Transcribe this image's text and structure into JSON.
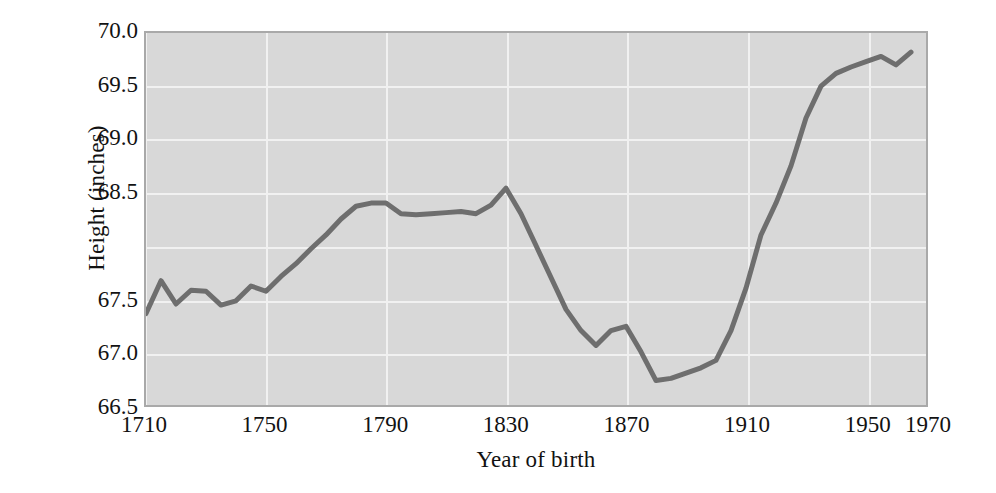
{
  "chart_data": {
    "type": "line",
    "title": "",
    "xlabel": "Year of birth",
    "ylabel": "Height (inches)",
    "xlim": [
      1710,
      1970
    ],
    "ylim": [
      66.5,
      70.0
    ],
    "grid": true,
    "legend": "none",
    "xticks": [
      "1710",
      "1750",
      "1790",
      "1830",
      "1870",
      "1910",
      "1950",
      "1970"
    ],
    "xtick_values": [
      1710,
      1750,
      1790,
      1830,
      1870,
      1910,
      1950,
      1970
    ],
    "yticks": [
      "70.0",
      "69.5",
      "69.0",
      "68.5",
      "",
      "67.5",
      "67.0",
      "66.5"
    ],
    "ytick_values": [
      70.0,
      69.5,
      69.0,
      68.5,
      68.0,
      67.5,
      67.0,
      66.5
    ],
    "series": [
      {
        "name": "Mean height by year of birth",
        "color": "#6e6e6e",
        "line_width": 5,
        "x": [
          1710,
          1715,
          1720,
          1725,
          1730,
          1735,
          1740,
          1745,
          1750,
          1755,
          1760,
          1765,
          1770,
          1775,
          1780,
          1785,
          1790,
          1795,
          1800,
          1805,
          1810,
          1815,
          1820,
          1825,
          1830,
          1835,
          1840,
          1845,
          1850,
          1855,
          1860,
          1865,
          1870,
          1875,
          1880,
          1885,
          1890,
          1895,
          1900,
          1905,
          1910,
          1915,
          1920,
          1925,
          1930,
          1935,
          1940,
          1945,
          1950,
          1955,
          1960,
          1965
        ],
        "y": [
          67.36,
          67.67,
          67.45,
          67.58,
          67.57,
          67.44,
          67.48,
          67.62,
          67.57,
          67.71,
          67.83,
          67.97,
          68.1,
          68.25,
          68.37,
          68.4,
          68.4,
          68.3,
          68.29,
          68.3,
          68.31,
          68.32,
          68.3,
          68.38,
          68.54,
          68.3,
          68.0,
          67.7,
          67.4,
          67.2,
          67.06,
          67.2,
          67.24,
          67.0,
          66.73,
          66.75,
          66.8,
          66.85,
          66.92,
          67.2,
          67.6,
          68.1,
          68.4,
          68.75,
          69.2,
          69.5,
          69.62,
          69.68,
          69.73,
          69.78,
          69.7,
          69.82
        ]
      }
    ]
  },
  "axes": {
    "x_title": "Year of birth",
    "y_title": "Height (inches)"
  },
  "colors": {
    "plot_background": "#d8d8d8",
    "gridline": "#f1f1f1",
    "frame": "#a9a9a9",
    "line": "#6e6e6e",
    "text": "#121212",
    "page_background": "#ffffff"
  }
}
